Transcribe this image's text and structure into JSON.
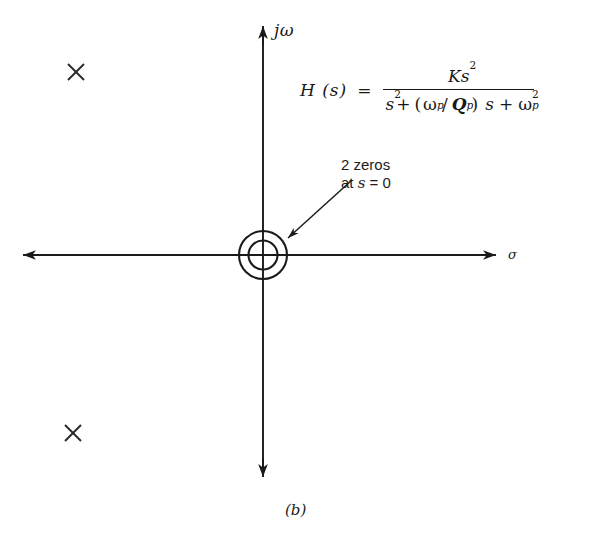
{
  "figure": {
    "caption": "(b)",
    "kind": "pole-zero-plot"
  },
  "axes": {
    "imaginary_label": "jω",
    "real_label": "σ",
    "origin": {
      "x": 263,
      "y": 255
    },
    "vertical": {
      "x": 263,
      "top_y": 25,
      "bottom_y": 478
    },
    "horizontal": {
      "y": 255,
      "left_x": 22,
      "right_x": 497
    }
  },
  "equation": {
    "lhs": "H (s)",
    "equals": "=",
    "numerator": {
      "K": "K",
      "s": "s",
      "s_exponent": "2"
    },
    "denominator": {
      "s": "s",
      "s_exponent": "2",
      "plus1": "+",
      "open_paren": "(",
      "omega": "ω",
      "omega_sub": "p",
      "slash": "/",
      "Q": "Q",
      "Q_sub": "p",
      "close_paren": ")",
      "s_linear": "s",
      "plus2": "+",
      "omega2": "ω",
      "omega2_sub": "p",
      "omega2_exponent": "2"
    },
    "plain_text": "H(s) = Ks^2 / (s^2 + (ω_p/Q_p)s + ω_p^2)"
  },
  "annotation": {
    "line1": "2 zeros",
    "line2_prefix": "at ",
    "line2_var": "s",
    "line2_suffix": " = 0"
  },
  "markers": {
    "zeros": [
      {
        "label": "double-zero-at-origin",
        "x": 263,
        "y": 255,
        "multiplicity": 2,
        "outer_radius": 24,
        "inner_radius": 15
      }
    ],
    "poles": [
      {
        "label": "pole-upper-left",
        "x": 76,
        "y": 72,
        "glyph": "×"
      },
      {
        "label": "pole-lower-left",
        "x": 73,
        "y": 433,
        "glyph": "×"
      }
    ]
  },
  "colors": {
    "ink": "#1a1a1a",
    "background": "#ffffff"
  }
}
